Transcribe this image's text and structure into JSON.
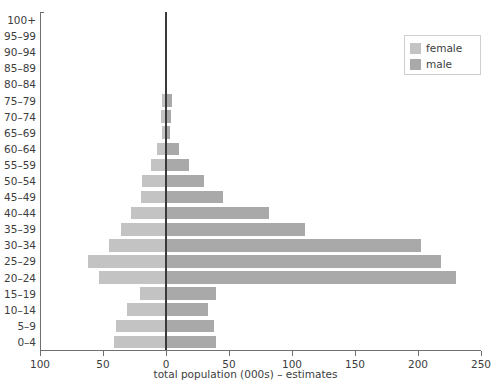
{
  "chart_data": {
    "type": "bar",
    "subtype": "population-pyramid",
    "title": "",
    "xlabel": "total population (000s) – estimates",
    "ylabel": "",
    "orientation": "horizontal",
    "grid": false,
    "legend_position": "top-right",
    "xlim": [
      -100,
      250
    ],
    "xticks": [
      -100,
      -50,
      0,
      50,
      100,
      150,
      200,
      250
    ],
    "xticklabels": [
      "100",
      "50",
      "0",
      "50",
      "100",
      "150",
      "200",
      "250"
    ],
    "categories": [
      "100+",
      "95–99",
      "90–94",
      "85–89",
      "80–84",
      "75–79",
      "70–74",
      "65–69",
      "60–64",
      "55–59",
      "50–54",
      "45–49",
      "40–44",
      "35–39",
      "30–34",
      "25–29",
      "20–24",
      "15–19",
      "10–14",
      "5–9",
      "0–4"
    ],
    "series": [
      {
        "name": "female",
        "color": "#c3c3c3",
        "direction": "left",
        "values": [
          0,
          0,
          0,
          0,
          0,
          3,
          4,
          3,
          7,
          12,
          19,
          20,
          28,
          36,
          45,
          62,
          53,
          21,
          31,
          40,
          41
        ]
      },
      {
        "name": "male",
        "color": "#a9a9a9",
        "direction": "right",
        "values": [
          0,
          0,
          0,
          0,
          0,
          5,
          4,
          3,
          10,
          18,
          30,
          45,
          82,
          110,
          202,
          218,
          230,
          40,
          33,
          38,
          40
        ]
      }
    ]
  },
  "legend": {
    "entries": [
      {
        "label": "female",
        "color": "#c3c3c3"
      },
      {
        "label": "male",
        "color": "#a9a9a9"
      }
    ]
  }
}
